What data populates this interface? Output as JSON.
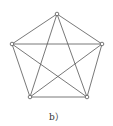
{
  "caption": "b）",
  "colors": {
    "edge": "#555555",
    "vertex_fill": "#ffffff",
    "vertex_stroke": "#555555"
  },
  "graph": {
    "type": "complete-graph-K5",
    "vertices": [
      {
        "id": "top",
        "x": 57,
        "y": 14
      },
      {
        "id": "left",
        "x": 12,
        "y": 44
      },
      {
        "id": "right",
        "x": 102,
        "y": 44
      },
      {
        "id": "bottom-left",
        "x": 30,
        "y": 97
      },
      {
        "id": "bottom-right",
        "x": 87,
        "y": 97
      }
    ],
    "edges": [
      [
        "top",
        "left"
      ],
      [
        "top",
        "right"
      ],
      [
        "top",
        "bottom-left"
      ],
      [
        "top",
        "bottom-right"
      ],
      [
        "left",
        "right"
      ],
      [
        "left",
        "bottom-left"
      ],
      [
        "left",
        "bottom-right"
      ],
      [
        "right",
        "bottom-left"
      ],
      [
        "right",
        "bottom-right"
      ],
      [
        "bottom-left",
        "bottom-right"
      ]
    ]
  }
}
